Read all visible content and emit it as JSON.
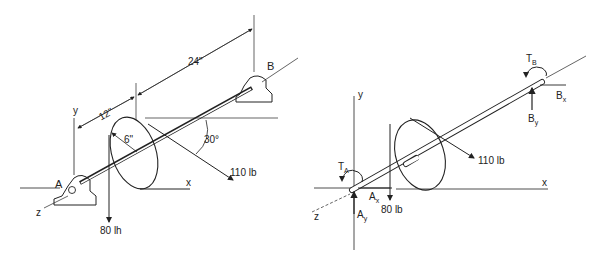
{
  "left_figure": {
    "title": "Shaft with disk on bearings",
    "dimensions": {
      "span_ab": "24\"",
      "span_a_disk": "12\"",
      "disk_radius": "6\""
    },
    "angle": "30°",
    "forces": {
      "belt_force": "110 lb",
      "weight": "80 lh"
    },
    "points": {
      "a": "A",
      "b": "B"
    },
    "axes": {
      "x": "x",
      "y": "y",
      "z": "z"
    }
  },
  "right_figure": {
    "title": "Free body diagram",
    "forces": {
      "belt_force": "110 lb",
      "weight": "80 lb"
    },
    "reactions": {
      "ax": "A",
      "ax_sub": "x",
      "ay": "A",
      "ay_sub": "y",
      "bx": "B",
      "bx_sub": "x",
      "by": "B",
      "by_sub": "y"
    },
    "torques": {
      "ta": "T",
      "ta_sub": "A",
      "tb": "T",
      "tb_sub": "B"
    },
    "axes": {
      "x": "x",
      "y": "y",
      "z": "z"
    }
  }
}
